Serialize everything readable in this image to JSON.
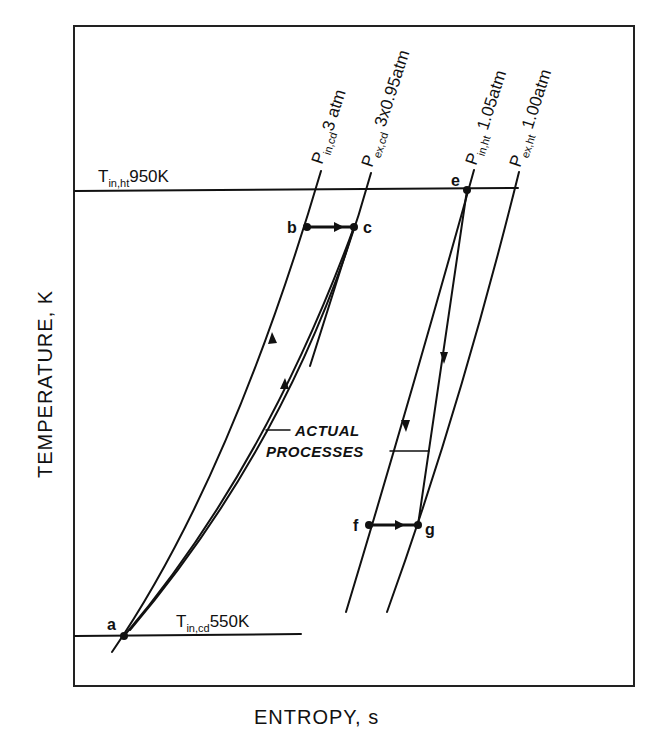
{
  "diagram": {
    "type": "T-s diagram",
    "axes": {
      "x_label": "ENTROPY, s",
      "y_label": "TEMPERATURE, K"
    },
    "isotherms": [
      {
        "id": "t_in_ht",
        "label_main": "T",
        "label_sub": "in,ht",
        "label_value": "950K"
      },
      {
        "id": "t_in_cd",
        "label_main": "T",
        "label_sub": "in,cd",
        "label_value": "550K"
      }
    ],
    "isobars": [
      {
        "id": "p_in_cd",
        "label_main": "P",
        "label_sub": "in,cd",
        "label_value": "3 atm"
      },
      {
        "id": "p_ex_cd",
        "label_main": "P",
        "label_sub": "ex,cd",
        "label_value": " 3x0.95atm"
      },
      {
        "id": "p_in_ht",
        "label_main": "P",
        "label_sub": "in,ht",
        "label_value": " 1.05atm"
      },
      {
        "id": "p_ex_ht",
        "label_main": "P",
        "label_sub": "ex,ht",
        "label_value": " 1.00atm"
      }
    ],
    "points": {
      "a": "a",
      "b": "b",
      "c": "c",
      "e": "e",
      "f": "f",
      "g": "g"
    },
    "annotation": {
      "line1": "ACTUAL",
      "line2": "PROCESSES"
    }
  }
}
